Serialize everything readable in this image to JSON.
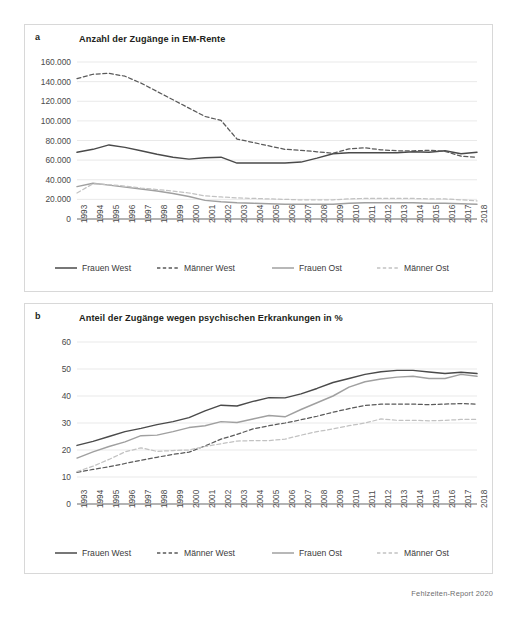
{
  "footer": {
    "source": "Fehlzeiten-Report 2020"
  },
  "panels": [
    {
      "letter": "a",
      "title": "Anzahl der Zugänge in EM-Rente",
      "legend": [
        {
          "label": "Frauen West",
          "style": "solid",
          "color": "#4a4a4a"
        },
        {
          "label": "Männer West",
          "style": "dashed",
          "color": "#5a5a5a"
        },
        {
          "label": "Frauen Ost",
          "style": "solid",
          "color": "#a0a0a0"
        },
        {
          "label": "Männer Ost",
          "style": "dashed",
          "color": "#c2c2c2"
        }
      ]
    },
    {
      "letter": "b",
      "title": "Anteil der Zugänge wegen psychischen Erkrankungen in %",
      "legend": [
        {
          "label": "Frauen West",
          "style": "solid",
          "color": "#4a4a4a"
        },
        {
          "label": "Männer West",
          "style": "dashed",
          "color": "#5a5a5a"
        },
        {
          "label": "Frauen Ost",
          "style": "solid",
          "color": "#a0a0a0"
        },
        {
          "label": "Männer Ost",
          "style": "dashed",
          "color": "#c2c2c2"
        }
      ]
    }
  ],
  "chart_data": [
    {
      "type": "line",
      "title": "Anzahl der Zugänge in EM-Rente",
      "panel": "a",
      "xlabel": "",
      "ylabel": "",
      "grid": true,
      "legend_position": "bottom",
      "ylim": [
        0,
        160000
      ],
      "yticks": [
        0,
        20000,
        40000,
        60000,
        80000,
        100000,
        120000,
        140000,
        160000
      ],
      "ytick_labels": [
        "0",
        "20.000",
        "40.000",
        "60.000",
        "80.000",
        "100.000",
        "120.000",
        "140.000",
        "160.000"
      ],
      "categories": [
        "1993",
        "1994",
        "1995",
        "1996",
        "1997",
        "1998",
        "1999",
        "2000",
        "2001",
        "2002",
        "2003",
        "2004",
        "2005",
        "2006",
        "2007",
        "2008",
        "2009",
        "2010",
        "2011",
        "2012",
        "2013",
        "2014",
        "2015",
        "2016",
        "2017",
        "2018"
      ],
      "series": [
        {
          "name": "Frauen West",
          "style": "solid",
          "color": "#4a4a4a",
          "values": [
            68000,
            71000,
            75500,
            73000,
            69500,
            66000,
            63000,
            61000,
            62500,
            63000,
            57000,
            57000,
            57000,
            57000,
            58000,
            62000,
            66500,
            67500,
            67500,
            67500,
            67500,
            68500,
            68000,
            69500,
            66500,
            68000
          ]
        },
        {
          "name": "Männer West",
          "style": "dashed",
          "color": "#5a5a5a",
          "values": [
            143000,
            147500,
            148500,
            145500,
            138500,
            130000,
            121500,
            113000,
            104500,
            100500,
            81500,
            78000,
            74500,
            71000,
            70000,
            68500,
            67000,
            71500,
            72500,
            70500,
            69500,
            69500,
            70000,
            69000,
            64000,
            63000
          ]
        },
        {
          "name": "Frauen Ost",
          "style": "solid",
          "color": "#a0a0a0",
          "values": [
            33000,
            36500,
            34500,
            32500,
            30500,
            28500,
            26000,
            23000,
            19000,
            17500,
            16500,
            16000,
            15500,
            15000,
            15000,
            15000,
            15000,
            16000,
            16500,
            16500,
            16500,
            16500,
            16000,
            16000,
            15500,
            15000
          ]
        },
        {
          "name": "Männer Ost",
          "style": "dashed",
          "color": "#c2c2c2",
          "values": [
            26500,
            36000,
            35000,
            33500,
            31500,
            30000,
            28500,
            26500,
            23500,
            22500,
            21500,
            21000,
            20500,
            20000,
            19500,
            19500,
            19500,
            20500,
            21000,
            21000,
            21000,
            21000,
            20500,
            20500,
            19500,
            18500
          ]
        }
      ]
    },
    {
      "type": "line",
      "title": "Anteil der Zugänge wegen psychischen Erkrankungen in %",
      "panel": "b",
      "xlabel": "",
      "ylabel": "%",
      "grid": true,
      "legend_position": "bottom",
      "ylim": [
        0,
        60
      ],
      "yticks": [
        0,
        10,
        20,
        30,
        40,
        50,
        60
      ],
      "ytick_labels": [
        "0",
        "10",
        "20",
        "30",
        "40",
        "50",
        "60"
      ],
      "categories": [
        "1993",
        "1994",
        "1995",
        "1996",
        "1997",
        "1998",
        "1999",
        "2000",
        "2001",
        "2002",
        "2003",
        "2004",
        "2005",
        "2006",
        "2007",
        "2008",
        "2009",
        "2010",
        "2011",
        "2012",
        "2013",
        "2014",
        "2015",
        "2016",
        "2017",
        "2018"
      ],
      "series": [
        {
          "name": "Frauen West",
          "style": "solid",
          "color": "#4a4a4a",
          "values": [
            21.7,
            23.2,
            25.0,
            26.8,
            28.0,
            29.4,
            30.5,
            32.0,
            34.5,
            36.6,
            36.3,
            38.0,
            39.4,
            39.3,
            40.8,
            42.8,
            45.0,
            46.5,
            48.0,
            49.0,
            49.5,
            49.5,
            48.9,
            48.3,
            48.8,
            48.3
          ]
        },
        {
          "name": "Männer West",
          "style": "dashed",
          "color": "#5a5a5a",
          "values": [
            11.7,
            12.8,
            13.8,
            15.0,
            16.2,
            17.3,
            18.4,
            19.2,
            21.5,
            24.0,
            25.8,
            27.8,
            29.0,
            30.0,
            31.2,
            32.5,
            34.0,
            35.3,
            36.5,
            37.0,
            37.0,
            37.0,
            36.8,
            37.0,
            37.2,
            37.0
          ]
        },
        {
          "name": "Frauen Ost",
          "style": "solid",
          "color": "#a0a0a0",
          "values": [
            17.0,
            19.3,
            21.3,
            23.0,
            25.3,
            25.5,
            26.8,
            28.3,
            29.0,
            30.5,
            30.2,
            31.5,
            32.8,
            32.3,
            35.0,
            37.5,
            40.0,
            43.3,
            45.3,
            46.3,
            47.0,
            47.3,
            46.5,
            46.5,
            48.0,
            47.3
          ]
        },
        {
          "name": "Männer Ost",
          "style": "dashed",
          "color": "#c2c2c2",
          "values": [
            12.0,
            14.0,
            16.5,
            19.3,
            20.8,
            19.5,
            19.8,
            20.0,
            21.3,
            22.3,
            23.3,
            23.5,
            23.5,
            24.0,
            25.5,
            26.8,
            27.8,
            29.0,
            30.0,
            31.5,
            31.0,
            31.0,
            30.8,
            31.0,
            31.3,
            31.3
          ]
        }
      ]
    }
  ]
}
